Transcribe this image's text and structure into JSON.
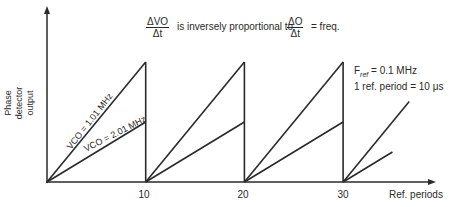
{
  "equation": {
    "left_numerator": "ΔVO",
    "left_denominator": "Δt",
    "relation": "is inversely proportional to",
    "right_numerator": "ΔO",
    "right_denominator": "Δt",
    "suffix": "= freq."
  },
  "y_axis_label_lines": [
    "Phase",
    "detector",
    "output"
  ],
  "x_axis_label": "Ref. periods",
  "x_ticks": [
    "10",
    "20",
    "30"
  ],
  "notes": {
    "fref_label": "F",
    "fref_sub": "ref",
    "fref_value": "= 0.1 MHz",
    "period": "1 ref. period = 10 μs"
  },
  "series": [
    {
      "name": "VCO = 1.01 MHz",
      "relative_peak": 1.0,
      "resets_at": [
        10,
        20,
        30
      ],
      "final_end_period": 6.7
    },
    {
      "name": "VCO = 2.01 MHz",
      "relative_peak": 0.5,
      "resets_at": [
        10,
        20,
        30
      ],
      "final_end_period": 5.0
    }
  ],
  "colors": {
    "ink": "#2a2a2a",
    "background": "#ffffff"
  }
}
